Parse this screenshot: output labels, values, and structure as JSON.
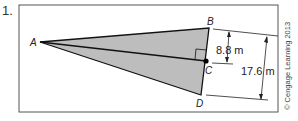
{
  "problem": {
    "number": "1."
  },
  "figure": {
    "points": {
      "A": {
        "label": "A",
        "x": 40,
        "y": 42
      },
      "B": {
        "label": "B",
        "x": 209,
        "y": 28
      },
      "C": {
        "label": "C",
        "x": 206,
        "y": 61
      },
      "D": {
        "label": "D",
        "x": 201,
        "y": 95
      }
    },
    "measurements": {
      "BC": "8.8 m",
      "BD": "17.6 m"
    },
    "fill_color": "#b8b8b8",
    "line_color": "#111111"
  },
  "copyright": "© Cengage Learning 2013"
}
